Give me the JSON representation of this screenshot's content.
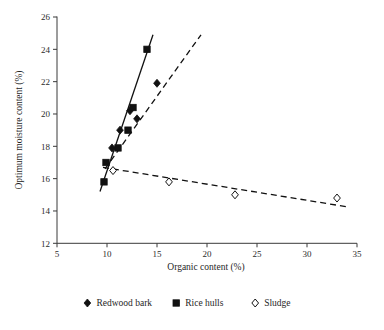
{
  "chart_data": {
    "type": "scatter",
    "title": "",
    "xlabel": "Organic content (%)",
    "ylabel": "Optimum moisture content (%)",
    "xlim": [
      5,
      35
    ],
    "ylim": [
      12,
      26
    ],
    "xticks": [
      5,
      10,
      15,
      20,
      25,
      30,
      35
    ],
    "yticks": [
      12,
      14,
      16,
      18,
      20,
      22,
      24,
      26
    ],
    "xtick_labels": [
      "5",
      "10",
      "15",
      "20",
      "25",
      "30",
      "35"
    ],
    "ytick_labels": [
      "12",
      "14",
      "16",
      "18",
      "20",
      "22",
      "24",
      "26"
    ],
    "grid": false,
    "legend_position": "below",
    "series": [
      {
        "name": "Redwood bark",
        "marker": "filled-diamond",
        "trendline": "dashed",
        "points": [
          {
            "x": 10.5,
            "y": 17.9
          },
          {
            "x": 11.3,
            "y": 19.0
          },
          {
            "x": 12.3,
            "y": 20.2
          },
          {
            "x": 13.0,
            "y": 19.7
          },
          {
            "x": 15.0,
            "y": 21.9
          }
        ],
        "trend_start": {
          "x": 9.8,
          "y": 16.6
        },
        "trend_end": {
          "x": 19.4,
          "y": 24.9
        }
      },
      {
        "name": "Rice hulls",
        "marker": "filled-square",
        "trendline": "solid",
        "points": [
          {
            "x": 9.7,
            "y": 15.8
          },
          {
            "x": 9.9,
            "y": 17.0
          },
          {
            "x": 11.1,
            "y": 17.9
          },
          {
            "x": 12.1,
            "y": 19.0
          },
          {
            "x": 12.6,
            "y": 20.4
          },
          {
            "x": 14.0,
            "y": 24.0
          }
        ],
        "trend_start": {
          "x": 9.3,
          "y": 15.2
        },
        "trend_end": {
          "x": 14.6,
          "y": 24.9
        }
      },
      {
        "name": "Sludge",
        "marker": "open-diamond",
        "trendline": "dashed",
        "points": [
          {
            "x": 10.6,
            "y": 16.5
          },
          {
            "x": 16.2,
            "y": 15.8
          },
          {
            "x": 22.8,
            "y": 15.0
          },
          {
            "x": 33.0,
            "y": 14.8
          }
        ],
        "trend_start": {
          "x": 9.6,
          "y": 16.7
        },
        "trend_end": {
          "x": 34.1,
          "y": 14.25
        }
      }
    ],
    "legend": [
      {
        "label": "Redwood bark",
        "marker": "filled-diamond"
      },
      {
        "label": "Rice hulls",
        "marker": "filled-square"
      },
      {
        "label": "Sludge",
        "marker": "open-diamond"
      }
    ]
  }
}
